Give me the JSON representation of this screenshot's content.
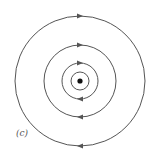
{
  "figure": {
    "label": "(c)",
    "center": {
      "x": 80,
      "y": 81
    },
    "center_dot_radius": 2.6,
    "line_color": "#555555",
    "dot_color": "#111111",
    "circles": [
      {
        "r": 9,
        "arrows": false
      },
      {
        "r": 18,
        "arrows": true
      },
      {
        "r": 36,
        "arrows": true
      },
      {
        "r": 65,
        "arrows": true
      }
    ],
    "direction": "clockwise"
  }
}
